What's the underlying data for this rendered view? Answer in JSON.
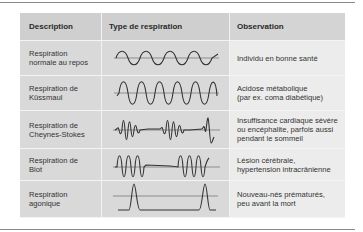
{
  "table": {
    "headers": {
      "description": "Description",
      "type": "Type de respiration",
      "observation": "Observation"
    },
    "rows": [
      {
        "description": "Respiration\nnormale au repos",
        "waveform": "regular-sine-moderate",
        "observation": "Individu en bonne santé"
      },
      {
        "description": "Respiration de\nKüssmaul",
        "waveform": "regular-sine-deep",
        "observation": "Acidose métabolique\n(par ex. coma diabétique)"
      },
      {
        "description": "Respiration de\nCheynes-Stokes",
        "waveform": "crescendo-decrescendo-with-pauses",
        "observation": "Insuffisance cardiaque sévère\nou encéphalite, parfois aussi\npendant le sommeil"
      },
      {
        "description": "Respiration de\nBiot",
        "waveform": "deep-bursts-with-apnea",
        "observation": "Lésion cérébrale,\nhypertension intracrânienne"
      },
      {
        "description": "Respiration\nagonique",
        "waveform": "isolated-gasps",
        "observation": "Nouveau-nés prématurés,\npeu avant la mort"
      }
    ]
  },
  "colors": {
    "header_bg": "#cfcfcf",
    "cell_bg": "#d9d9d9",
    "observation_bg": "#ececec",
    "rule": "#8a8a8a"
  }
}
